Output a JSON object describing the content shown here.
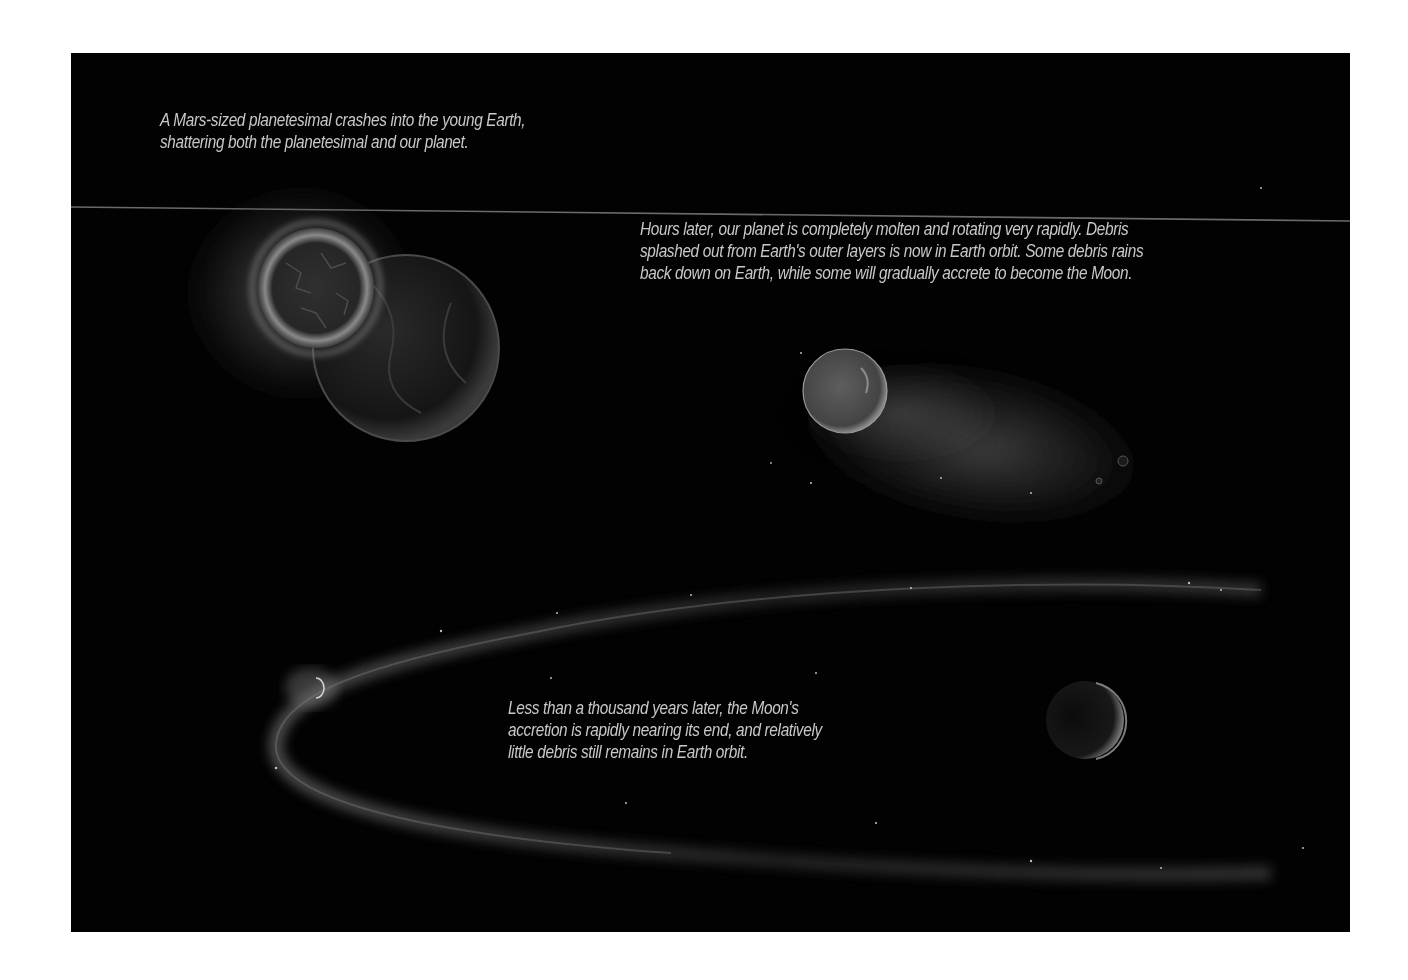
{
  "figure": {
    "background_color": "#020202",
    "page_color": "#ffffff",
    "captions": [
      {
        "id": "impact",
        "lines": [
          "A Mars-sized planetesimal crashes into the young Earth,",
          "shattering both the planetesimal and our planet."
        ]
      },
      {
        "id": "hours-later",
        "lines": [
          "Hours later, our planet is completely molten and rotating very rapidly. Debris",
          "splashed out from Earth's outer layers is now in Earth orbit. Some debris rains",
          "back down on Earth, while some will gradually accrete to become the Moon."
        ]
      },
      {
        "id": "thousand-years",
        "lines": [
          "Less than a thousand years later, the Moon's",
          "accretion is rapidly nearing its end, and relatively",
          "little debris still remains in Earth orbit."
        ]
      }
    ],
    "scenes": [
      {
        "id": "collision",
        "description": "Planetesimal colliding with young Earth"
      },
      {
        "id": "molten-earth",
        "description": "Molten Earth with debris cloud"
      },
      {
        "id": "debris-ring",
        "description": "Thin debris ring with forming Moon"
      }
    ]
  }
}
